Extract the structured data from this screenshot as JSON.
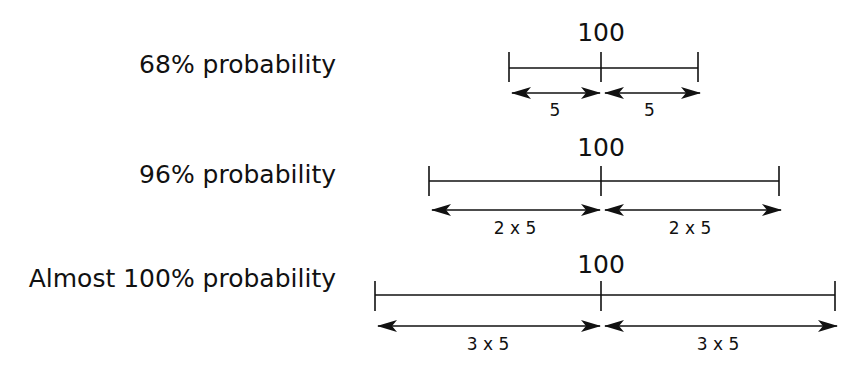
{
  "diagram": {
    "center_value": "100",
    "rows": [
      {
        "label": "68% probability",
        "center_label": "100",
        "left_span_label": "5",
        "right_span_label": "5",
        "geometry": {
          "left_x": 509,
          "center_x": 601,
          "right_x": 698,
          "line_y": 68,
          "tick_top": 52,
          "tick_bottom": 82,
          "arrow_y": 93,
          "label_y": 76,
          "center_label_y": 18,
          "span_label_y": 100
        }
      },
      {
        "label": "96% probability",
        "center_label": "100",
        "left_span_label": "2 x 5",
        "right_span_label": "2 x 5",
        "geometry": {
          "left_x": 429,
          "center_x": 601,
          "right_x": 779,
          "line_y": 181,
          "tick_top": 166,
          "tick_bottom": 196,
          "arrow_y": 210,
          "label_y": 186,
          "center_label_y": 133,
          "span_label_y": 218
        }
      },
      {
        "label": "Almost 100% probability",
        "center_label": "100",
        "left_span_label": "3 x 5",
        "right_span_label": "3 x 5",
        "geometry": {
          "left_x": 375,
          "center_x": 601,
          "right_x": 835,
          "line_y": 295,
          "tick_top": 281,
          "tick_bottom": 311,
          "arrow_y": 326,
          "label_y": 290,
          "center_label_y": 250,
          "span_label_y": 334
        }
      }
    ],
    "colors": {
      "ink": "#111111",
      "background": "#ffffff"
    }
  }
}
